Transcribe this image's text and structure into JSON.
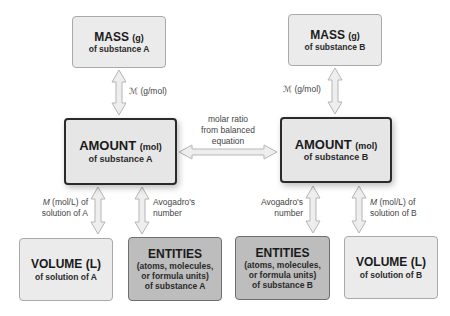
{
  "diagram": {
    "boxes": {
      "mass_a": {
        "title": "MASS",
        "unit": "(g)",
        "sub": "of substance A"
      },
      "mass_b": {
        "title": "MASS",
        "unit": "(g)",
        "sub": "of substance B"
      },
      "amount_a": {
        "title": "AMOUNT",
        "unit": "(mol)",
        "sub": "of substance A"
      },
      "amount_b": {
        "title": "AMOUNT",
        "unit": "(mol)",
        "sub": "of substance B"
      },
      "volume_a": {
        "title": "VOLUME (L)",
        "sub": "of solution of A"
      },
      "volume_b": {
        "title": "VOLUME (L)",
        "sub": "of solution of B"
      },
      "entities_a": {
        "title": "ENTITIES",
        "line1": "(atoms, molecules,",
        "line2": "or formula units)",
        "sub": "of substance A"
      },
      "entities_b": {
        "title": "ENTITIES",
        "line1": "(atoms, molecules,",
        "line2": "or formula units)",
        "sub": "of substance B"
      }
    },
    "arrow_labels": {
      "molar_mass_a": {
        "symbol": "ℳ",
        "text": " (g/mol)"
      },
      "molar_mass_b": {
        "symbol": "ℳ",
        "text": " (g/mol)"
      },
      "molar_ratio": {
        "line1": "molar ratio",
        "line2": "from balanced",
        "line3": "equation"
      },
      "molarity_a": {
        "symbol": "M",
        "line1": " (mol/L) of",
        "line2": "solution of A"
      },
      "molarity_b": {
        "symbol": "M",
        "line1": " (mol/L) of",
        "line2": "solution of B"
      },
      "avogadro_a": {
        "line1": "Avogadro's",
        "line2": "number"
      },
      "avogadro_b": {
        "line1": "Avogadro's",
        "line2": "number"
      }
    },
    "colors": {
      "light_box": "#ebebeb",
      "dark_box": "#bdbdbd",
      "amount_box": "#e6e6e6",
      "arrow_fill": "#eeeeee",
      "arrow_stroke": "#b5b5b5"
    }
  }
}
